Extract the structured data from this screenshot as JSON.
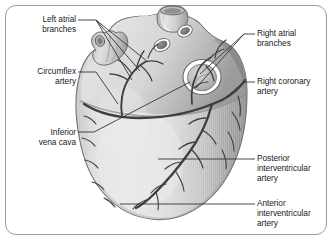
{
  "figure": {
    "kind": "anatomical-illustration",
    "border_color": "#9b9b9b",
    "background_color": "#ffffff"
  },
  "palette": {
    "myocardium_light": "#e3e3e3",
    "myocardium_mid": "#cfcfcf",
    "myocardium_shadow": "#9c9c9c",
    "myocardium_deep_shadow": "#868686",
    "vessel_stroke": "#4a4a4a",
    "vessel_dark": "#3a3a3a",
    "outline": "#5a5a5a",
    "highlight": "#f2f2f2",
    "leader_line": "#2b2b2b",
    "text": "#1b1b1b"
  },
  "labels": [
    {
      "id": "left-atrial-branches",
      "text": "Left atrial\nbranches",
      "side": "left",
      "x": 14,
      "y": 14,
      "width": 62
    },
    {
      "id": "circumflex-artery",
      "text": "Circumflex\nartery",
      "side": "left",
      "x": 10,
      "y": 66,
      "width": 66
    },
    {
      "id": "inferior-vena-cava",
      "text": "Inferior\nvena cava",
      "side": "left",
      "x": 12,
      "y": 127,
      "width": 64
    },
    {
      "id": "right-atrial-branches",
      "text": "Right atrial\nbranches",
      "side": "right",
      "x": 257,
      "y": 28,
      "width": 74
    },
    {
      "id": "right-coronary-artery",
      "text": "Right coronary\nartery",
      "side": "right",
      "x": 257,
      "y": 76,
      "width": 76
    },
    {
      "id": "posterior-interventricular-artery",
      "text": "Posterior\ninterventricular\nartery",
      "side": "right",
      "x": 257,
      "y": 153,
      "width": 74
    },
    {
      "id": "anterior-interventricular-artery",
      "text": "Anterior\ninterventricular\nartery",
      "side": "right",
      "x": 257,
      "y": 198,
      "width": 74
    }
  ],
  "anatomy_features": [
    {
      "id": "superior-vena-cava-stump",
      "description": "Cut tubular vessel at superior aspect"
    },
    {
      "id": "pulmonary-vein-opening-upper",
      "description": "Oval vessel opening, upper"
    },
    {
      "id": "pulmonary-vein-opening-lower",
      "description": "Oval vessel opening, lower"
    },
    {
      "id": "inferior-vena-cava-opening",
      "description": "Large ringed opening with white rim"
    },
    {
      "id": "left-atrial-appendage",
      "description": "Lobed projection at left border"
    },
    {
      "id": "coronary-sulcus",
      "description": "Horizontal groove carrying circumflex artery"
    },
    {
      "id": "apex-of-heart",
      "description": "Rounded inferior tip of ventricular mass"
    }
  ]
}
